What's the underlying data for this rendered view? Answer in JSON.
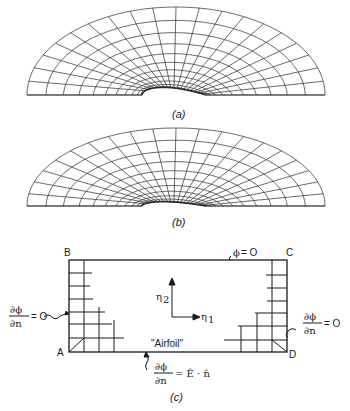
{
  "figures": [
    {
      "id": "a",
      "caption": "(a)",
      "description": "Elliptic body-fitted grid around airfoil (thicker)",
      "radial_lines": 21,
      "arc_lines": 12,
      "airfoil_thickness": "thick"
    },
    {
      "id": "b",
      "caption": "(b)",
      "description": "Elliptic body-fitted grid around airfoil (thinner)",
      "radial_lines": 21,
      "arc_lines": 12,
      "airfoil_thickness": "thin"
    }
  ],
  "panel_c": {
    "caption": "(c)",
    "corners": {
      "top_left": "B",
      "top_right": "C",
      "bottom_left": "A",
      "bottom_right": "D"
    },
    "top_boundary": {
      "phi": "ϕ",
      "eq": "= O"
    },
    "left_boundary": {
      "num": "∂ϕ",
      "den": "∂n",
      "eq": "= O"
    },
    "right_boundary": {
      "num": "∂ϕ",
      "den": "∂n",
      "eq": "= O"
    },
    "bottom_boundary": {
      "num": "∂ϕ",
      "den": "∂n",
      "eq": "= Ê · n̂"
    },
    "axes": {
      "eta1": "η",
      "eta1_sub": "1",
      "eta2": "η",
      "eta2_sub": "2"
    },
    "airfoil_label": "\"Airfoil\""
  }
}
